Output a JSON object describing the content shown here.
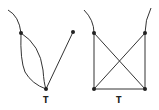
{
  "diagram": {
    "type": "graph-drawings",
    "graphs": [
      {
        "id": "left",
        "label": "T",
        "nodes": [
          {
            "x": 21,
            "y": 33
          },
          {
            "x": 73,
            "y": 32
          },
          {
            "x": 46,
            "y": 89
          }
        ],
        "edges": [
          [
            0,
            2
          ],
          [
            0,
            2
          ],
          [
            1,
            2
          ]
        ],
        "dangling": "curve from top-left into upper-left node"
      },
      {
        "id": "right",
        "label": "T",
        "nodes": [
          {
            "x": 94,
            "y": 33
          },
          {
            "x": 145,
            "y": 33
          },
          {
            "x": 94,
            "y": 89
          },
          {
            "x": 145,
            "y": 89
          }
        ],
        "edges": [
          [
            0,
            2
          ],
          [
            1,
            3
          ],
          [
            2,
            3
          ],
          [
            0,
            3
          ],
          [
            1,
            2
          ]
        ],
        "dangling": "curves rising from both top nodes"
      }
    ],
    "line_color": "#333333"
  }
}
